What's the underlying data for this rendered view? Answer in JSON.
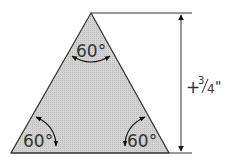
{
  "diagram": {
    "shape": "equilateral-triangle",
    "fill_color": "#cfcfcf",
    "stroke_color": "#222222",
    "angles": {
      "top": "60°",
      "bottom_left": "60°",
      "bottom_right": "60°"
    },
    "dimension": {
      "label": "+¾\"",
      "prefix": "+",
      "numerator": "3",
      "denominator": "4",
      "unit": "\""
    }
  }
}
